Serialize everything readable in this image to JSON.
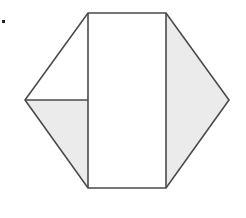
{
  "diagram": {
    "colors": {
      "stroke": "#4a4a4a",
      "shade": "#ebebeb",
      "background": "#ffffff"
    },
    "marker_dot": {
      "x": 3,
      "y": 21
    },
    "rectangle": {
      "x1": 88,
      "y1": 13,
      "x2": 166,
      "y2": 188
    },
    "left_vertex": {
      "x": 25,
      "y": 100
    },
    "right_vertex": {
      "x": 229,
      "y": 100
    },
    "shaded_regions": [
      "lower-left triangle",
      "right triangle"
    ],
    "labels": []
  }
}
